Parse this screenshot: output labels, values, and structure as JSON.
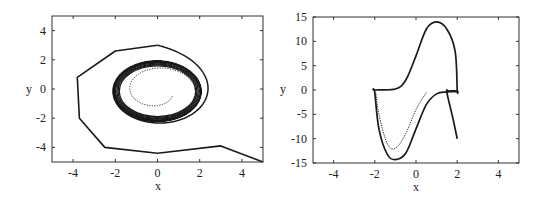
{
  "chart_data": [
    {
      "type": "line",
      "panel": "left",
      "title": "",
      "xlabel": "x",
      "ylabel": "y",
      "xlim": [
        -5,
        5
      ],
      "ylim": [
        -5,
        5
      ],
      "xticks": [
        -4,
        -2,
        0,
        2,
        4
      ],
      "yticks": [
        -4,
        -2,
        0,
        2,
        4
      ],
      "grid": false,
      "legend": null,
      "description": "Phase portrait: solid trajectories spiraling inward to a limit cycle (radius ~2), dotted trajectory spiraling outward from origin to the same limit cycle",
      "series": [
        {
          "name": "outer trajectory (solid)",
          "style": "solid",
          "start": [
            5,
            -5
          ],
          "approx_points": [
            [
              5,
              -5
            ],
            [
              3,
              -3.9
            ],
            [
              0,
              -4.4
            ],
            [
              -2.5,
              -4
            ],
            [
              -3.7,
              -2
            ],
            [
              -3.8,
              0.8
            ],
            [
              -2,
              2.6
            ],
            [
              0,
              3
            ],
            [
              1.8,
              2.6
            ],
            [
              2.8,
              1
            ],
            [
              2.6,
              -1.3
            ],
            [
              1,
              -2.6
            ],
            [
              -1,
              -2.6
            ],
            [
              -2.5,
              -1.5
            ],
            [
              -2.5,
              0.8
            ],
            [
              -1,
              2.3
            ],
            [
              1,
              2.3
            ],
            [
              2.2,
              0.8
            ],
            [
              2.1,
              -1.2
            ],
            [
              0.5,
              -2.3
            ],
            [
              -1.5,
              -2.1
            ],
            [
              -2.2,
              -0.2
            ]
          ]
        },
        {
          "name": "limit cycle",
          "style": "solid-dense",
          "center": [
            0,
            -0.2
          ],
          "rx": 2.1,
          "ry": 2.0
        },
        {
          "name": "inner trajectory (dotted)",
          "style": "dotted",
          "start": [
            0.7,
            -0.5
          ],
          "spiral_to": "limit cycle"
        }
      ]
    },
    {
      "type": "line",
      "panel": "right",
      "title": "",
      "xlabel": "x",
      "ylabel": "y",
      "xlim": [
        -5,
        5
      ],
      "ylim": [
        -15,
        15
      ],
      "xticks": [
        -4,
        -2,
        0,
        2,
        4
      ],
      "yticks": [
        -15,
        -10,
        -5,
        0,
        5,
        10,
        15
      ],
      "grid": false,
      "legend": null,
      "description": "Relaxation-oscillation (Van der Pol, large mu) phase plane: solid trajectory starting at (2,-10) converging onto a limit cycle with cubic-shaped branches; dotted trajectory from (0.5,-0.5) converging to the same cycle",
      "series": [
        {
          "name": "solid trajectory",
          "style": "solid",
          "approx_points": [
            [
              2,
              -10
            ],
            [
              1.8,
              -6
            ],
            [
              1.5,
              -0.5
            ],
            [
              1.6,
              -0.2
            ],
            [
              2,
              -0.2
            ],
            [
              2,
              0
            ],
            [
              1.9,
              8
            ],
            [
              1.5,
              12.5
            ],
            [
              1,
              14
            ],
            [
              0.5,
              12.5
            ],
            [
              0,
              7
            ],
            [
              -0.5,
              2
            ],
            [
              -1,
              0.2
            ],
            [
              -2,
              0
            ],
            [
              -2,
              -0.5
            ],
            [
              -1.8,
              -8
            ],
            [
              -1.4,
              -13.2
            ],
            [
              -1,
              -14.3
            ],
            [
              -0.5,
              -13
            ],
            [
              0,
              -8
            ],
            [
              0.5,
              -3
            ],
            [
              1,
              -0.8
            ],
            [
              1.5,
              -0.4
            ],
            [
              2,
              -0.3
            ]
          ]
        },
        {
          "name": "dotted trajectory",
          "style": "dotted",
          "approx_points": [
            [
              0.5,
              -0.5
            ],
            [
              0,
              -4
            ],
            [
              -0.5,
              -9
            ],
            [
              -1,
              -12
            ],
            [
              -1.4,
              -11
            ],
            [
              -1.8,
              -5
            ],
            [
              -1.95,
              -0.5
            ]
          ]
        }
      ]
    }
  ],
  "panels": {
    "left": {
      "xlabel": "x",
      "ylabel": "y",
      "xtick_labels": [
        "-4",
        "-2",
        "0",
        "2",
        "4"
      ],
      "ytick_labels": [
        "4",
        "2",
        "0",
        "-2",
        "-4"
      ]
    },
    "right": {
      "xlabel": "x",
      "ylabel": "y",
      "xtick_labels": [
        "-4",
        "-2",
        "0",
        "2",
        "4"
      ],
      "ytick_labels": [
        "15",
        "10",
        "5",
        "0",
        "-5",
        "-10",
        "-15"
      ]
    }
  },
  "colors": {
    "line": "#1a1a1a",
    "frame": "#333333",
    "text": "#222222"
  }
}
